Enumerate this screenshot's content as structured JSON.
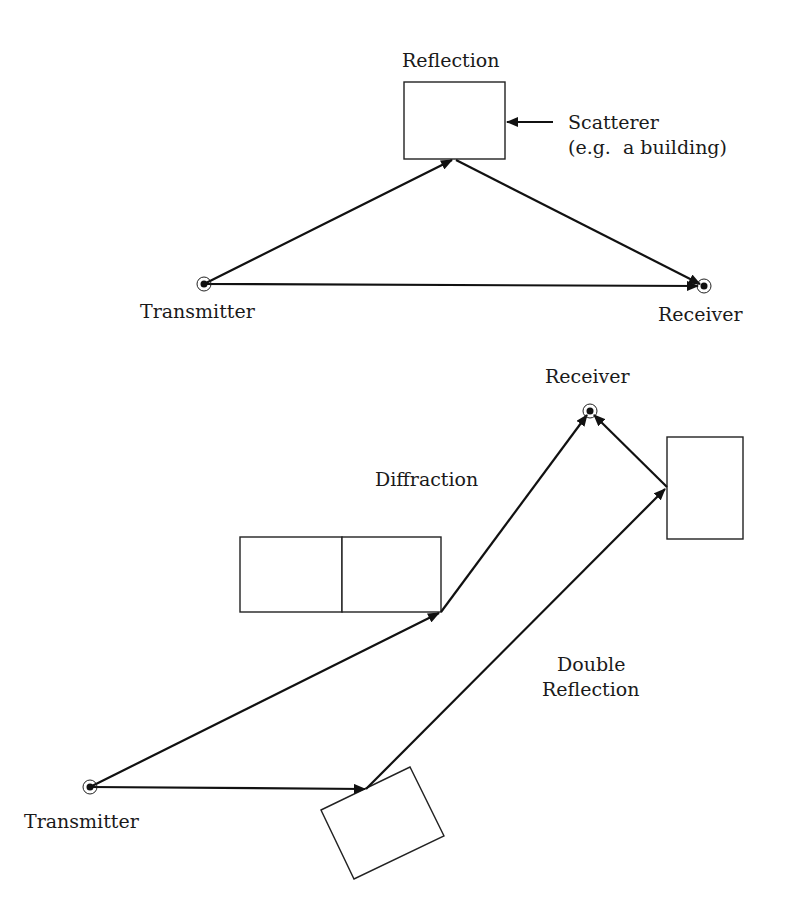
{
  "diagram": {
    "top": {
      "labels": {
        "reflection": "Reflection",
        "scatterer_line1": "Scatterer",
        "scatterer_line2": "(e.g.  a building)",
        "transmitter": "Transmitter",
        "receiver": "Receiver"
      },
      "nodes": {
        "transmitter": {
          "x": 204,
          "y": 284
        },
        "receiver": {
          "x": 704,
          "y": 286
        },
        "reflection_point": {
          "x": 454,
          "y": 159
        }
      },
      "scatterer_box": {
        "x": 404,
        "y": 82,
        "w": 101,
        "h": 77
      }
    },
    "bottom": {
      "labels": {
        "receiver": "Receiver",
        "diffraction": "Diffraction",
        "double_reflection_line1": "Double",
        "double_reflection_line2": "Reflection",
        "transmitter": "Transmitter"
      },
      "nodes": {
        "transmitter": {
          "x": 90,
          "y": 787
        },
        "receiver": {
          "x": 590,
          "y": 411
        },
        "diffraction_point": {
          "x": 441,
          "y": 612
        },
        "first_reflection_point": {
          "x": 366,
          "y": 789
        },
        "second_reflection_point": {
          "x": 667,
          "y": 487
        }
      },
      "diffraction_boxes": [
        {
          "x": 240,
          "y": 537,
          "w": 102,
          "h": 75
        },
        {
          "x": 342,
          "y": 537,
          "w": 99,
          "h": 75
        }
      ],
      "right_box": {
        "x": 667,
        "y": 437,
        "w": 76,
        "h": 102
      },
      "rotated_box": "321,810 410,767 444,836 354,879"
    }
  }
}
